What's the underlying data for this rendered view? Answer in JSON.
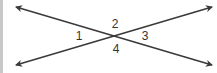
{
  "diagram": {
    "type": "intersecting-lines",
    "line_color": "#3a3a3a",
    "label_color": "#333333",
    "intersection": {
      "x": 113,
      "y": 35
    },
    "lines": [
      {
        "name": "line-a",
        "from": {
          "x": 16,
          "y": 7
        },
        "to": {
          "x": 212,
          "y": 65
        }
      },
      {
        "name": "line-b",
        "from": {
          "x": 16,
          "y": 65
        },
        "to": {
          "x": 212,
          "y": 7
        }
      }
    ],
    "angles": [
      {
        "label": "1",
        "x": 79,
        "y": 40
      },
      {
        "label": "2",
        "x": 115,
        "y": 28
      },
      {
        "label": "3",
        "x": 145,
        "y": 40
      },
      {
        "label": "4",
        "x": 116,
        "y": 53
      }
    ]
  }
}
